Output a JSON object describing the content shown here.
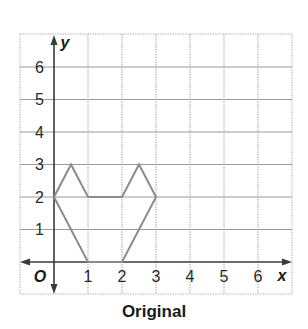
{
  "figure": {
    "caption": "Original",
    "axis_labels": {
      "x": "x",
      "y": "y",
      "origin": "O"
    },
    "x_ticks": [
      "1",
      "2",
      "3",
      "4",
      "5",
      "6"
    ],
    "y_ticks": [
      "1",
      "2",
      "3",
      "4",
      "5",
      "6"
    ],
    "colors": {
      "grid_horizontal": "#9a9a9a",
      "grid_vertical": "#a8a8a8",
      "frame": "#b0b0b0",
      "axes": "#3a3a3a",
      "shape": "#8c8c8c",
      "text": "#1a1a1a"
    }
  },
  "chart_data": {
    "type": "scatter",
    "title": "Original",
    "xlabel": "x",
    "ylabel": "y",
    "xlim": [
      -1,
      7
    ],
    "ylim": [
      -1,
      7
    ],
    "grid": true,
    "series": [
      {
        "name": "Original figure (closed polygon)",
        "points": [
          [
            0,
            2
          ],
          [
            0.5,
            3
          ],
          [
            1,
            2
          ],
          [
            2,
            2
          ],
          [
            2.5,
            3
          ],
          [
            3,
            2
          ],
          [
            2,
            0
          ],
          [
            1,
            0
          ],
          [
            0,
            2
          ]
        ]
      }
    ]
  }
}
